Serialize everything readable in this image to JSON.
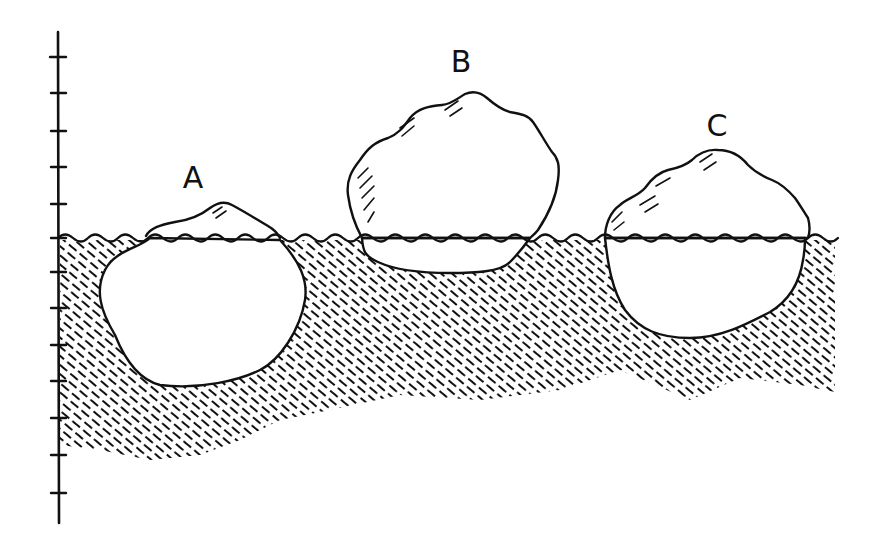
{
  "diagram": {
    "colors": {
      "ink": "#111111",
      "background": "#ffffff"
    },
    "axis": {
      "orientation": "vertical",
      "x": 58,
      "y_top": 32,
      "y_bottom": 523,
      "tick_count": 13,
      "waterline_tick_index": 5,
      "ticks_above_water": 5,
      "ticks_below_water": 7
    },
    "waterline": {
      "y": 238,
      "x_start": 58,
      "x_end": 835
    },
    "icebergs": [
      {
        "label": "A",
        "label_x": 193,
        "label_y": 188,
        "above_water": "small",
        "below_water": "large"
      },
      {
        "label": "B",
        "label_x": 461,
        "label_y": 72,
        "above_water": "large",
        "below_water": "small"
      },
      {
        "label": "C",
        "label_x": 717,
        "label_y": 136,
        "above_water": "medium",
        "below_water": "medium"
      }
    ]
  }
}
